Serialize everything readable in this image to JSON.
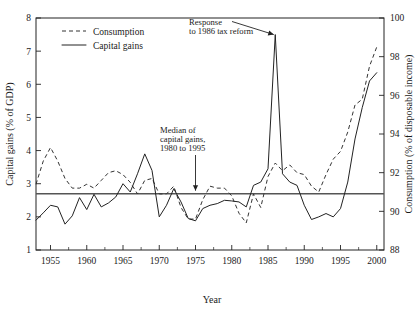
{
  "chart_data": {
    "type": "line",
    "title": "",
    "xlabel": "Year",
    "ylabel": "Capital gains (% of GDP)",
    "ylabel_right": "Consumption (% of disposable income)",
    "xlim": [
      1953,
      2001
    ],
    "ylim": [
      1,
      8
    ],
    "ylim_right": [
      88,
      100
    ],
    "xticks": [
      1955,
      1960,
      1965,
      1970,
      1975,
      1980,
      1985,
      1990,
      1995,
      2000
    ],
    "xtick_labels": [
      "1955",
      "1960",
      "1965",
      "1970",
      "1975",
      "1980",
      "1985",
      "1990",
      "1995",
      "2000"
    ],
    "yticks": [
      1,
      2,
      3,
      4,
      5,
      6,
      7,
      8
    ],
    "ytick_labels": [
      "1",
      "2",
      "3",
      "4",
      "5",
      "6",
      "7",
      "8"
    ],
    "yticks_right": [
      88,
      90,
      92,
      94,
      96,
      98,
      100
    ],
    "ytick_labels_right": [
      "88",
      "90",
      "92",
      "94",
      "96",
      "98",
      "100"
    ],
    "grid": false,
    "legend_position": "top-left",
    "series": [
      {
        "name": "Consumption",
        "style": "dashed",
        "axis": "right",
        "color": "#333333",
        "x": [
          1953,
          1954,
          1955,
          1956,
          1957,
          1958,
          1959,
          1960,
          1961,
          1962,
          1963,
          1964,
          1965,
          1966,
          1967,
          1968,
          1969,
          1970,
          1971,
          1972,
          1973,
          1974,
          1975,
          1976,
          1977,
          1978,
          1979,
          1980,
          1981,
          1982,
          1983,
          1984,
          1985,
          1986,
          1987,
          1988,
          1989,
          1990,
          1991,
          1992,
          1993,
          1994,
          1995,
          1996,
          1997,
          1998,
          1999,
          2000
        ],
        "values": [
          91.4,
          92.6,
          93.3,
          92.6,
          91.7,
          91.2,
          91.2,
          91.4,
          91.2,
          91.6,
          92.0,
          92.1,
          91.9,
          91.5,
          90.9,
          91.6,
          91.7,
          90.9,
          90.9,
          91.3,
          90.2,
          89.6,
          89.6,
          90.6,
          91.3,
          91.2,
          91.2,
          90.8,
          89.9,
          89.4,
          90.9,
          90.2,
          91.8,
          92.5,
          92.1,
          92.4,
          92.0,
          91.9,
          91.3,
          91.0,
          91.9,
          92.7,
          93.1,
          94.1,
          95.5,
          95.8,
          97.5,
          98.5
        ]
      },
      {
        "name": "Capital gains",
        "style": "solid",
        "axis": "left",
        "color": "#222222",
        "x": [
          1953,
          1954,
          1955,
          1956,
          1957,
          1958,
          1959,
          1960,
          1961,
          1962,
          1963,
          1964,
          1965,
          1966,
          1967,
          1968,
          1969,
          1970,
          1971,
          1972,
          1973,
          1974,
          1975,
          1976,
          1977,
          1978,
          1979,
          1980,
          1981,
          1982,
          1983,
          1984,
          1985,
          1986,
          1987,
          1988,
          1989,
          1990,
          1991,
          1992,
          1993,
          1994,
          1995,
          1996,
          1997,
          1998,
          1999,
          2000
        ],
        "values": [
          1.9,
          2.12,
          2.35,
          2.3,
          1.78,
          2.03,
          2.58,
          2.22,
          2.68,
          2.3,
          2.42,
          2.6,
          3.0,
          2.75,
          3.3,
          3.9,
          3.4,
          2.0,
          2.35,
          2.85,
          2.45,
          1.95,
          1.88,
          2.25,
          2.35,
          2.4,
          2.5,
          2.48,
          2.45,
          2.3,
          2.95,
          3.05,
          3.45,
          7.5,
          3.3,
          3.05,
          2.95,
          2.35,
          1.92,
          2.0,
          2.1,
          2.0,
          2.25,
          3.05,
          4.35,
          5.3,
          6.1,
          6.35
        ]
      }
    ],
    "annotations": [
      {
        "id": "response-annotation",
        "lines": [
          "Response",
          "to 1986 tax reform"
        ],
        "target_x": 1986,
        "target_y": 7.5
      },
      {
        "id": "median-annotation",
        "lines": [
          "Median of",
          "capital gains,",
          "1980 to 1995"
        ],
        "target_x": 1975,
        "target_y": 2.7
      }
    ],
    "reference_lines": [
      {
        "id": "median-capital-gains",
        "label": "Median of capital gains, 1980 to 1995",
        "value": 2.7,
        "axis": "left",
        "color": "#555555"
      }
    ]
  },
  "legend": {
    "items": [
      {
        "label": "Consumption",
        "style": "dashed"
      },
      {
        "label": "Capital gains",
        "style": "solid"
      }
    ]
  }
}
